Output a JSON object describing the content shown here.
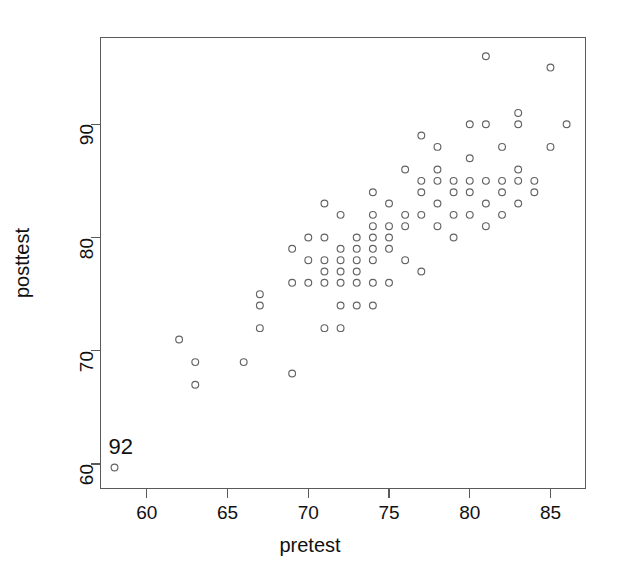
{
  "figure": {
    "background_color": "#ffffff",
    "frame_color": "#5a5a5a",
    "point_color": "#636363"
  },
  "annotations": [
    {
      "name": "outlier-case-label",
      "text": "92",
      "x": 58,
      "y": 59.7
    }
  ],
  "chart_data": {
    "type": "scatter",
    "title": "",
    "subtitle": "",
    "xlabel": "pretest",
    "ylabel": "posttest",
    "xlim": [
      57.1,
      87.2
    ],
    "ylim": [
      57.8,
      97.7
    ],
    "xticks": [
      60,
      65,
      70,
      75,
      80,
      85
    ],
    "xticklabels": [
      "60",
      "65",
      "70",
      "75",
      "80",
      "85"
    ],
    "yticks": [
      60,
      70,
      80,
      90
    ],
    "yticklabels": [
      "60",
      "70",
      "80",
      "90"
    ],
    "grid": false,
    "legend": null,
    "marker": "open-circle",
    "marker_size": 3.4,
    "series": [
      {
        "name": "students",
        "x": [
          58,
          62,
          63,
          63,
          66,
          67,
          67,
          67,
          69,
          69,
          69,
          70,
          70,
          70,
          71,
          71,
          71,
          71,
          71,
          71,
          72,
          72,
          72,
          72,
          72,
          72,
          72,
          73,
          73,
          73,
          73,
          73,
          73,
          74,
          74,
          74,
          74,
          74,
          74,
          74,
          74,
          75,
          75,
          75,
          75,
          75,
          76,
          76,
          76,
          76,
          77,
          77,
          77,
          77,
          77,
          78,
          78,
          78,
          78,
          78,
          79,
          79,
          79,
          79,
          80,
          80,
          80,
          80,
          80,
          81,
          81,
          81,
          81,
          81,
          82,
          82,
          82,
          82,
          83,
          83,
          83,
          83,
          83,
          84,
          84,
          85,
          85,
          86
        ],
        "y": [
          59.7,
          71,
          69,
          67,
          69,
          75,
          74,
          72,
          79,
          76,
          68,
          80,
          78,
          76,
          83,
          80,
          78,
          77,
          76,
          72,
          82,
          79,
          78,
          77,
          76,
          74,
          72,
          80,
          79,
          78,
          77,
          76,
          74,
          84,
          82,
          81,
          80,
          79,
          78,
          76,
          74,
          83,
          81,
          80,
          79,
          76,
          86,
          82,
          81,
          78,
          89,
          85,
          84,
          82,
          77,
          88,
          86,
          85,
          83,
          81,
          85,
          84,
          82,
          80,
          90,
          87,
          85,
          84,
          82,
          96,
          90,
          85,
          83,
          81,
          88,
          85,
          84,
          82,
          91,
          90,
          86,
          85,
          83,
          85,
          84,
          95,
          88,
          90
        ]
      }
    ]
  }
}
